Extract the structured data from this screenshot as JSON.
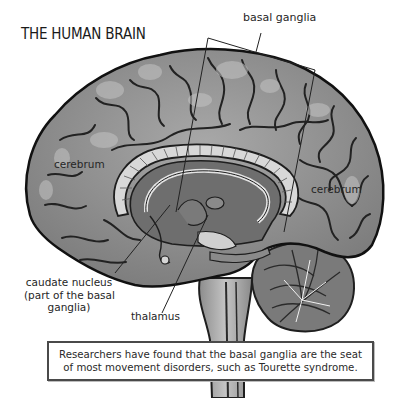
{
  "title": "THE HUMAN BRAIN",
  "labels": {
    "basal_ganglia": "basal ganglia",
    "cerebrum_left": "cerebrum",
    "cerebrum_right": "cerebrum",
    "caudate_line1": "caudate nucleus",
    "caudate_line2": "(part of the basal",
    "caudate_line3": "ganglia)",
    "thalamus": "thalamus"
  },
  "caption": {
    "line1": "Researchers have found that the basal ganglia are the seat",
    "line2": "of most movement disorders, such as Tourette syndrome."
  },
  "colors": {
    "cortex": "#8e8e8e",
    "cortex_highlight": "#b9b9b9",
    "sulcus": "#262626",
    "deep_gray": "#6d6d6d",
    "brainstem": "#a5a5a5",
    "leader_line": "#222222"
  }
}
